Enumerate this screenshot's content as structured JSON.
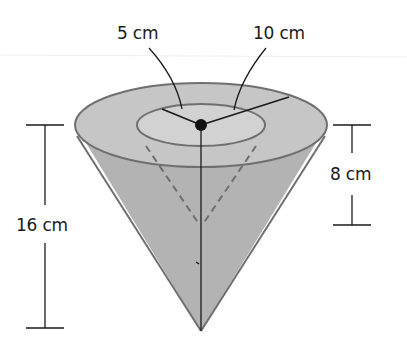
{
  "diagram": {
    "type": "cone-within-cone",
    "labels": {
      "inner_radius": "5 cm",
      "outer_radius": "10 cm",
      "outer_height": "16 cm",
      "inner_height": "8 cm"
    },
    "colors": {
      "cone_fill": "#b4b4b4",
      "top_fill": "#c9c9c9",
      "inner_top_fill": "#d3d3d3",
      "outline": "#6f6f6f",
      "line": "#1a1a1a"
    }
  }
}
